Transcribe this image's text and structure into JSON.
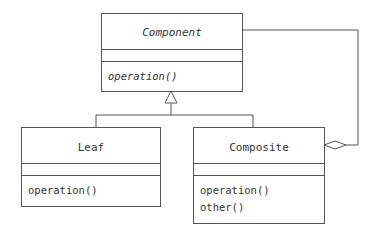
{
  "diagram": {
    "type": "UML class diagram (Composite pattern)",
    "classes": [
      {
        "name": "Component",
        "abstract": true,
        "attributes": [],
        "operations": [
          "operation()"
        ]
      },
      {
        "name": "Leaf",
        "abstract": false,
        "attributes": [],
        "operations": [
          "operation()"
        ]
      },
      {
        "name": "Composite",
        "abstract": false,
        "attributes": [],
        "operations": [
          "operation()",
          "other()"
        ]
      }
    ],
    "relationships": [
      {
        "type": "generalization",
        "from": "Leaf",
        "to": "Component"
      },
      {
        "type": "generalization",
        "from": "Composite",
        "to": "Component"
      },
      {
        "type": "aggregation",
        "whole": "Composite",
        "part": "Component"
      }
    ],
    "line_color": "#555555"
  }
}
